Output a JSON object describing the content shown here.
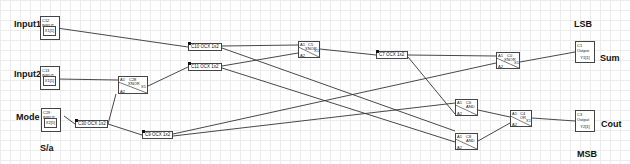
{
  "labels": {
    "input1": "Input1",
    "input2": "Input2",
    "mode": "Mode",
    "sa": "S/a",
    "lsb": "LSB",
    "msb": "MSB",
    "sum": "Sum",
    "cout": "Cout"
  },
  "inputs": [
    {
      "id": "C12",
      "type": "INPUT",
      "port": "X1[1]"
    },
    {
      "id": "C13",
      "type": "INPUT",
      "port": "X1[1]"
    },
    {
      "id": "C29",
      "type": "INPUT",
      "port": "X2[1]"
    }
  ],
  "outputs": [
    {
      "id": "C1",
      "type": "Output",
      "port": "Y1[1]"
    },
    {
      "id": "C3",
      "type": "Output",
      "port": "Y2[1]"
    }
  ],
  "delays": [
    {
      "label": "C10 OCX 1x2"
    },
    {
      "label": "C11 OCX 1x2"
    },
    {
      "label": "C30 OCX 1x2"
    },
    {
      "label": "C9 OCX 1x2"
    },
    {
      "label": "C7 OCX 1x2"
    }
  ],
  "gates": [
    {
      "id": "C28",
      "type": "XNOR",
      "in1": "A1",
      "in2": "A2",
      "out": "X1"
    },
    {
      "id": "C5",
      "type": "XNOR",
      "in1": "A1",
      "in2": "A2",
      "out": "X1"
    },
    {
      "id": "C0",
      "type": "XNOR",
      "in1": "A1",
      "in2": "A2",
      "out": "X1"
    },
    {
      "id": "C6",
      "type": "AND",
      "in1": "A1",
      "in2": "A2",
      "out": ""
    },
    {
      "id": "C8",
      "type": "AND",
      "in1": "A1",
      "in2": "A2",
      "out": ""
    },
    {
      "id": "C4",
      "type": "OR",
      "in1": "A1",
      "in2": "A2",
      "out": "X1"
    }
  ]
}
